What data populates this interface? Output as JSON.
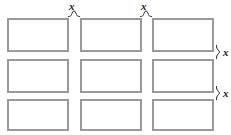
{
  "diagram": {
    "background_color": "#ffffff",
    "rectangle": {
      "fill_color": "#ffffff",
      "border_color": "#9a9a9a",
      "border_width_px": 2
    },
    "label_color": "#1a1a1a",
    "grid": {
      "rows": 3,
      "columns": 3,
      "cells": [
        {
          "row": 0,
          "column": 0,
          "label": ""
        },
        {
          "row": 0,
          "column": 1,
          "label": ""
        },
        {
          "row": 0,
          "column": 2,
          "label": ""
        },
        {
          "row": 1,
          "column": 0,
          "label": ""
        },
        {
          "row": 1,
          "column": 1,
          "label": ""
        },
        {
          "row": 1,
          "column": 2,
          "label": ""
        },
        {
          "row": 2,
          "column": 0,
          "label": ""
        },
        {
          "row": 2,
          "column": 1,
          "label": ""
        },
        {
          "row": 2,
          "column": 2,
          "label": ""
        }
      ]
    },
    "gap_labels": {
      "top": [
        {
          "text": "x",
          "position": "between-column-1-and-2"
        },
        {
          "text": "x",
          "position": "between-column-2-and-3"
        }
      ],
      "right": [
        {
          "text": "x",
          "position": "between-row-1-and-2"
        },
        {
          "text": "x",
          "position": "between-row-2-and-3"
        }
      ]
    }
  }
}
